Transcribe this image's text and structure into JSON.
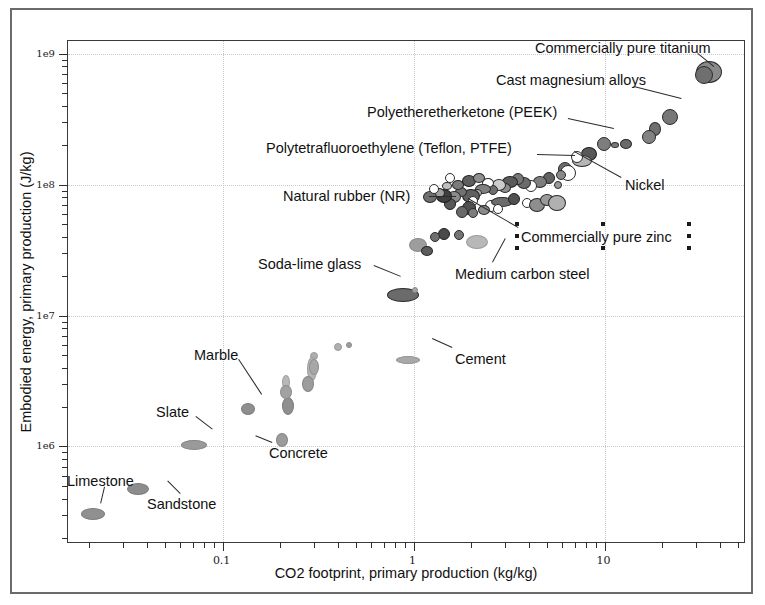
{
  "chart_data": {
    "type": "scatter",
    "title": "",
    "xlabel": "CO2 footprint, primary production (kg/kg)",
    "ylabel": "Embodied energy, primary production (J/kg)",
    "xscale": "log",
    "yscale": "log",
    "xlim": [
      0.0155,
      55
    ],
    "ylim": [
      180000,
      1250000000
    ],
    "grid": true,
    "legend": "none",
    "x_ticks": [
      "0.1",
      "1",
      "10"
    ],
    "x_tick_values": [
      0.1,
      1,
      10
    ],
    "y_ticks": [
      "1e6",
      "1e7",
      "1e8",
      "1e9"
    ],
    "y_tick_values": [
      1000000,
      10000000,
      100000000,
      1000000000
    ],
    "annotations": [
      {
        "label": "Commercially pure titanium",
        "x": 35,
        "y": 720000000.0
      },
      {
        "label": "Cast magnesium alloys",
        "x": 13.5,
        "y": 300000000.0
      },
      {
        "label": "Polyetheretherketone (PEEK)",
        "x": 6.8,
        "y": 185000000.0
      },
      {
        "label": "Polytetrafluoroethylene (Teflon, PTFE)",
        "x": 4.3,
        "y": 125000000.0
      },
      {
        "label": "Natural rubber (NR)",
        "x": 2.05,
        "y": 76000000.0
      },
      {
        "label": "Nickel",
        "x": 7.4,
        "y": 115000000.0
      },
      {
        "label": "Commercially pure zinc",
        "x": 3.4,
        "y": 88000000.0
      },
      {
        "label": "Medium carbon steel",
        "x": 2.15,
        "y": 33000000.0
      },
      {
        "label": "Soda-lime glass",
        "x": 0.85,
        "y": 15000000.0
      },
      {
        "label": "Cement",
        "x": 0.95,
        "y": 4600000.0
      },
      {
        "label": "Marble",
        "x": 0.125,
        "y": 1900000.0
      },
      {
        "label": "Slate",
        "x": 0.072,
        "y": 1050000.0
      },
      {
        "label": "Concrete",
        "x": 0.2,
        "y": 1100000.0
      },
      {
        "label": "Limestone",
        "x": 0.021,
        "y": 330000.0
      },
      {
        "label": "Sandstone",
        "x": 0.036,
        "y": 460000.0
      }
    ],
    "points": [
      {
        "x": 35.0,
        "y": 730000000.0,
        "rx": 13,
        "ry": 11,
        "fill": "#8a8a8a",
        "stroke": "#2b2b2b"
      },
      {
        "x": 33.2,
        "y": 690000000.0,
        "rx": 9,
        "ry": 9,
        "fill": "#6f6f6f",
        "stroke": "#2b2b2b"
      },
      {
        "x": 22.0,
        "y": 330000000.0,
        "rx": 8,
        "ry": 8,
        "fill": "#777777",
        "stroke": "#2b2b2b"
      },
      {
        "x": 18.3,
        "y": 265000000.0,
        "rx": 6,
        "ry": 7,
        "fill": "#707070",
        "stroke": "#2b2b2b"
      },
      {
        "x": 17.0,
        "y": 230000000.0,
        "rx": 7,
        "ry": 7,
        "fill": "#828282",
        "stroke": "#2b2b2b"
      },
      {
        "x": 13.0,
        "y": 205000000.0,
        "rx": 6,
        "ry": 5,
        "fill": "#6a6a6a",
        "stroke": "#2b2b2b"
      },
      {
        "x": 11.4,
        "y": 200000000.0,
        "rx": 4,
        "ry": 3,
        "fill": "#7a7a7a",
        "stroke": "#2b2b2b"
      },
      {
        "x": 9.9,
        "y": 205000000.0,
        "rx": 7,
        "ry": 7,
        "fill": "#7d7d7d",
        "stroke": "#2b2b2b"
      },
      {
        "x": 8.3,
        "y": 172000000.0,
        "rx": 8,
        "ry": 7,
        "fill": "#585858",
        "stroke": "#1f1f1f"
      },
      {
        "x": 7.6,
        "y": 152000000.0,
        "rx": 10,
        "ry": 6,
        "fill": "#b6b6b6",
        "stroke": "#2b2b2b"
      },
      {
        "x": 7.2,
        "y": 162000000.0,
        "rx": 6,
        "ry": 6,
        "fill": "#ffffff",
        "stroke": "#2b2b2b"
      },
      {
        "x": 6.2,
        "y": 132000000.0,
        "rx": 7,
        "ry": 7,
        "fill": "#6d6d6d",
        "stroke": "#2b2b2b"
      },
      {
        "x": 6.4,
        "y": 122000000.0,
        "rx": 8,
        "ry": 8,
        "fill": "#ffffff",
        "stroke": "#2b2b2b"
      },
      {
        "x": 5.9,
        "y": 118000000.0,
        "rx": 5,
        "ry": 5,
        "fill": "#898989",
        "stroke": "#2b2b2b"
      },
      {
        "x": 5.7,
        "y": 100000000.0,
        "rx": 4,
        "ry": 4,
        "fill": "#9a9a9a",
        "stroke": "#2b2b2b"
      },
      {
        "x": 5.1,
        "y": 112000000.0,
        "rx": 6,
        "ry": 6,
        "fill": "#636363",
        "stroke": "#1f1f1f"
      },
      {
        "x": 4.6,
        "y": 104000000.0,
        "rx": 7,
        "ry": 6,
        "fill": "#7e7e7e",
        "stroke": "#2b2b2b"
      },
      {
        "x": 4.1,
        "y": 98000000.0,
        "rx": 6,
        "ry": 6,
        "fill": "#ffffff",
        "stroke": "#2b2b2b"
      },
      {
        "x": 3.8,
        "y": 102000000.0,
        "rx": 7,
        "ry": 6,
        "fill": "#6b6b6b",
        "stroke": "#2b2b2b"
      },
      {
        "x": 3.5,
        "y": 110000000.0,
        "rx": 6,
        "ry": 6,
        "fill": "#777777",
        "stroke": "#2b2b2b"
      },
      {
        "x": 3.2,
        "y": 105000000.0,
        "rx": 8,
        "ry": 6,
        "fill": "#5a5a5a",
        "stroke": "#1f1f1f"
      },
      {
        "x": 3.0,
        "y": 94000000.0,
        "rx": 6,
        "ry": 5,
        "fill": "#8d8d8d",
        "stroke": "#2b2b2b"
      },
      {
        "x": 2.8,
        "y": 99000000.0,
        "rx": 7,
        "ry": 6,
        "fill": "#cccccc",
        "stroke": "#2b2b2b"
      },
      {
        "x": 2.6,
        "y": 91000000.0,
        "rx": 5,
        "ry": 5,
        "fill": "#6e6e6e",
        "stroke": "#2b2b2b"
      },
      {
        "x": 2.45,
        "y": 102000000.0,
        "rx": 6,
        "ry": 5,
        "fill": "#ffffff",
        "stroke": "#2b2b2b"
      },
      {
        "x": 2.3,
        "y": 92000000.0,
        "rx": 8,
        "ry": 5,
        "fill": "#808080",
        "stroke": "#2b2b2b"
      },
      {
        "x": 2.15,
        "y": 86000000.0,
        "rx": 5,
        "ry": 4,
        "fill": "#b3b3b3",
        "stroke": "#2b2b2b"
      },
      {
        "x": 2.0,
        "y": 82000000.0,
        "rx": 9,
        "ry": 7,
        "fill": "#5f5f5f",
        "stroke": "#1f1f1f"
      },
      {
        "x": 1.78,
        "y": 88000000.0,
        "rx": 6,
        "ry": 5,
        "fill": "#727272",
        "stroke": "#2b2b2b"
      },
      {
        "x": 1.62,
        "y": 80000000.0,
        "rx": 7,
        "ry": 6,
        "fill": "#8b8b8b",
        "stroke": "#2b2b2b"
      },
      {
        "x": 2.05,
        "y": 75500000.0,
        "rx": 5,
        "ry": 5,
        "fill": "#ffffff",
        "stroke": "#2b2b2b"
      },
      {
        "x": 2.55,
        "y": 69000000.0,
        "rx": 6,
        "ry": 6,
        "fill": "#ffffff",
        "stroke": "#2b2b2b"
      },
      {
        "x": 2.9,
        "y": 74000000.0,
        "rx": 11,
        "ry": 5,
        "fill": "#6c6c6c",
        "stroke": "#2b2b2b"
      },
      {
        "x": 3.35,
        "y": 78000000.0,
        "rx": 6,
        "ry": 6,
        "fill": "#505050",
        "stroke": "#1f1f1f"
      },
      {
        "x": 3.9,
        "y": 72000000.0,
        "rx": 5,
        "ry": 5,
        "fill": "#ffffff",
        "stroke": "#2b2b2b"
      },
      {
        "x": 4.4,
        "y": 70000000.0,
        "rx": 8,
        "ry": 7,
        "fill": "#8e8e8e",
        "stroke": "#2b2b2b"
      },
      {
        "x": 5.0,
        "y": 76000000.0,
        "rx": 7,
        "ry": 6,
        "fill": "#9a9a9a",
        "stroke": "#2b2b2b"
      },
      {
        "x": 5.6,
        "y": 73000000.0,
        "rx": 9,
        "ry": 8,
        "fill": "#b0b0b0",
        "stroke": "#2b2b2b"
      },
      {
        "x": 1.95,
        "y": 66000000.0,
        "rx": 7,
        "ry": 7,
        "fill": "#4f4f4f",
        "stroke": "#1f1f1f"
      },
      {
        "x": 1.8,
        "y": 62000000.0,
        "rx": 6,
        "ry": 6,
        "fill": "#6a6a6a",
        "stroke": "#2b2b2b"
      },
      {
        "x": 2.05,
        "y": 60500000.0,
        "rx": 5,
        "ry": 5,
        "fill": "#7d7d7d",
        "stroke": "#2b2b2b"
      },
      {
        "x": 2.35,
        "y": 64000000.0,
        "rx": 6,
        "ry": 5,
        "fill": "#8b8b8b",
        "stroke": "#2b2b2b"
      },
      {
        "x": 2.75,
        "y": 65000000.0,
        "rx": 5,
        "ry": 5,
        "fill": "#ffffff",
        "stroke": "#2b2b2b"
      },
      {
        "x": 1.55,
        "y": 71000000.0,
        "rx": 6,
        "ry": 6,
        "fill": "#585858",
        "stroke": "#1f1f1f"
      },
      {
        "x": 1.45,
        "y": 82000000.0,
        "rx": 8,
        "ry": 7,
        "fill": "#3f3f3f",
        "stroke": "#1f1f1f"
      },
      {
        "x": 1.35,
        "y": 87000000.0,
        "rx": 6,
        "ry": 5,
        "fill": "#a0a0a0",
        "stroke": "#2b2b2b"
      },
      {
        "x": 1.22,
        "y": 80000000.0,
        "rx": 7,
        "ry": 6,
        "fill": "#6f6f6f",
        "stroke": "#2b2b2b"
      },
      {
        "x": 1.28,
        "y": 93000000.0,
        "rx": 5,
        "ry": 5,
        "fill": "#ffffff",
        "stroke": "#2b2b2b"
      },
      {
        "x": 1.5,
        "y": 98000000.0,
        "rx": 5,
        "ry": 4,
        "fill": "#c0c0c0",
        "stroke": "#2b2b2b"
      },
      {
        "x": 1.7,
        "y": 100000000.0,
        "rx": 6,
        "ry": 5,
        "fill": "#7b7b7b",
        "stroke": "#2b2b2b"
      },
      {
        "x": 1.95,
        "y": 106000000.0,
        "rx": 7,
        "ry": 6,
        "fill": "#5e5e5e",
        "stroke": "#1f1f1f"
      },
      {
        "x": 2.2,
        "y": 112000000.0,
        "rx": 6,
        "ry": 5,
        "fill": "#8f8f8f",
        "stroke": "#2b2b2b"
      },
      {
        "x": 1.55,
        "y": 112000000.0,
        "rx": 5,
        "ry": 5,
        "fill": "#ffffff",
        "stroke": "#2b2b2b"
      },
      {
        "x": 1.45,
        "y": 42000000.0,
        "rx": 6,
        "ry": 6,
        "fill": "#4a4a4a",
        "stroke": "#1f1f1f"
      },
      {
        "x": 1.3,
        "y": 40000000.0,
        "rx": 5,
        "ry": 5,
        "fill": "#6e6e6e",
        "stroke": "#2b2b2b"
      },
      {
        "x": 1.72,
        "y": 41000000.0,
        "rx": 5,
        "ry": 5,
        "fill": "#747474",
        "stroke": "#2b2b2b"
      },
      {
        "x": 2.15,
        "y": 36500000.0,
        "rx": 11,
        "ry": 7,
        "fill": "#b8b8b8",
        "stroke": "#9a9a9a"
      },
      {
        "x": 1.05,
        "y": 34500000.0,
        "rx": 9,
        "ry": 7,
        "fill": "#9d9d9d",
        "stroke": "#8a8a8a"
      },
      {
        "x": 1.18,
        "y": 31000000.0,
        "rx": 6,
        "ry": 5,
        "fill": "#5c5c5c",
        "stroke": "#2b2b2b"
      },
      {
        "x": 0.88,
        "y": 14300000.0,
        "rx": 16,
        "ry": 7,
        "fill": "#6b6b6b",
        "stroke": "#2b2b2b"
      },
      {
        "x": 1.02,
        "y": 15800000.0,
        "rx": 3,
        "ry": 3,
        "fill": "#a5a5a5",
        "stroke": "#8a8a8a"
      },
      {
        "x": 0.93,
        "y": 4550000.0,
        "rx": 12,
        "ry": 4,
        "fill": "#a8a8a8",
        "stroke": "#949494"
      },
      {
        "x": 0.4,
        "y": 5800000.0,
        "rx": 4,
        "ry": 4,
        "fill": "#b0b0b0",
        "stroke": "#9a9a9a"
      },
      {
        "x": 0.46,
        "y": 6000000.0,
        "rx": 3,
        "ry": 3,
        "fill": "#9e9e9e",
        "stroke": "#8a8a8a"
      },
      {
        "x": 0.3,
        "y": 4900000.0,
        "rx": 4,
        "ry": 4,
        "fill": "#aeaeae",
        "stroke": "#9a9a9a"
      },
      {
        "x": 0.295,
        "y": 3900000.0,
        "rx": 5,
        "ry": 12,
        "fill": "#b4b4b4",
        "stroke": "#9d9d9d"
      },
      {
        "x": 0.215,
        "y": 3100000.0,
        "rx": 4,
        "ry": 7,
        "fill": "#b8b8b8",
        "stroke": "#a0a0a0"
      },
      {
        "x": 0.22,
        "y": 2050000.0,
        "rx": 6,
        "ry": 9,
        "fill": "#8f8f8f",
        "stroke": "#7a7a7a"
      },
      {
        "x": 0.215,
        "y": 2600000.0,
        "rx": 6,
        "ry": 7,
        "fill": "#a2a2a2",
        "stroke": "#8c8c8c"
      },
      {
        "x": 0.28,
        "y": 3000000.0,
        "rx": 6,
        "ry": 8,
        "fill": "#9c9c9c",
        "stroke": "#868686"
      },
      {
        "x": 0.3,
        "y": 4050000.0,
        "rx": 5,
        "ry": 8,
        "fill": "#a7a7a7",
        "stroke": "#909090"
      },
      {
        "x": 0.135,
        "y": 1920000.0,
        "rx": 7,
        "ry": 6,
        "fill": "#8f8f8f",
        "stroke": "#7a7a7a"
      },
      {
        "x": 0.205,
        "y": 1120000.0,
        "rx": 6,
        "ry": 7,
        "fill": "#9b9b9b",
        "stroke": "#858585"
      },
      {
        "x": 0.071,
        "y": 1030000.0,
        "rx": 13,
        "ry": 5,
        "fill": "#9a9a9a",
        "stroke": "#858585"
      },
      {
        "x": 0.036,
        "y": 470000.0,
        "rx": 11,
        "ry": 6,
        "fill": "#8d8d8d",
        "stroke": "#7a7a7a"
      },
      {
        "x": 0.021,
        "y": 305000.0,
        "rx": 12,
        "ry": 6,
        "fill": "#909090",
        "stroke": "#7c7c7c"
      }
    ]
  },
  "axes": {
    "y_title": "Embodied energy, primary production (J/kg)",
    "x_title": "CO2 footprint, primary production (kg/kg)",
    "y_tick_labels": [
      "1e9",
      "1e8",
      "1e7",
      "1e6"
    ],
    "x_tick_labels": [
      "0.1",
      "1",
      "10"
    ]
  },
  "labels": {
    "titanium": "Commercially pure titanium",
    "magnesium": "Cast magnesium alloys",
    "peek": "Polyetheretherketone (PEEK)",
    "ptfe": "Polytetrafluoroethylene (Teflon, PTFE)",
    "rubber": "Natural rubber (NR)",
    "nickel": "Nickel",
    "zinc": "Commercially pure zinc",
    "steel": "Medium carbon steel",
    "glass": "Soda-lime glass",
    "cement": "Cement",
    "marble": "Marble",
    "slate": "Slate",
    "concrete": "Concrete",
    "limestone": "Limestone",
    "sandstone": "Sandstone"
  }
}
